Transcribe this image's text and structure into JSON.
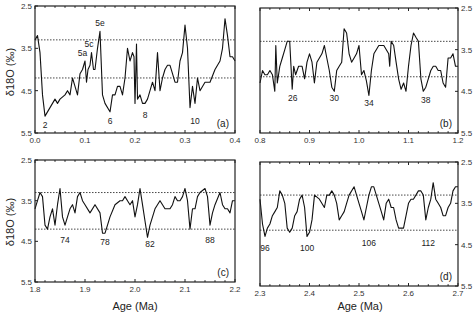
{
  "chart_data": [
    {
      "type": "line",
      "panel": "(a)",
      "xlabel": "",
      "ylabel": "δ18O (‰)",
      "xlim": [
        0.0,
        0.4
      ],
      "ylim": [
        5.5,
        2.5
      ],
      "y_inverted": true,
      "xticks": [
        "0.0",
        "0.1",
        "0.2",
        "0.3",
        "0.4"
      ],
      "yticks": [
        "2.5",
        "3.5",
        "4.5",
        "5.5"
      ],
      "reference_lines": [
        3.3,
        4.2
      ],
      "annotations": [
        {
          "text": "2",
          "x": 0.02,
          "y": 5.15
        },
        {
          "text": "5a",
          "x": 0.095,
          "y": 3.75
        },
        {
          "text": "5c",
          "x": 0.108,
          "y": 3.55
        },
        {
          "text": "5e",
          "x": 0.13,
          "y": 3.05
        },
        {
          "text": "6",
          "x": 0.15,
          "y": 5.05
        },
        {
          "text": "8",
          "x": 0.22,
          "y": 4.9
        },
        {
          "text": "10",
          "x": 0.32,
          "y": 5.05
        }
      ],
      "x": [
        0.0,
        0.005,
        0.01,
        0.015,
        0.02,
        0.03,
        0.04,
        0.045,
        0.05,
        0.06,
        0.065,
        0.07,
        0.075,
        0.08,
        0.085,
        0.09,
        0.095,
        0.1,
        0.103,
        0.106,
        0.11,
        0.113,
        0.117,
        0.12,
        0.125,
        0.13,
        0.135,
        0.14,
        0.15,
        0.155,
        0.16,
        0.165,
        0.17,
        0.175,
        0.18,
        0.185,
        0.19,
        0.195,
        0.198,
        0.2,
        0.203,
        0.205,
        0.21,
        0.215,
        0.22,
        0.225,
        0.23,
        0.235,
        0.24,
        0.245,
        0.25,
        0.255,
        0.26,
        0.265,
        0.27,
        0.275,
        0.28,
        0.285,
        0.29,
        0.295,
        0.3,
        0.305,
        0.31,
        0.315,
        0.32,
        0.325,
        0.33,
        0.34,
        0.35,
        0.36,
        0.37,
        0.375,
        0.38,
        0.385,
        0.39,
        0.395,
        0.4
      ],
      "y": [
        3.3,
        3.2,
        3.6,
        4.6,
        5.1,
        4.9,
        4.7,
        4.8,
        4.7,
        4.6,
        4.5,
        4.6,
        4.2,
        4.4,
        4.6,
        4.1,
        4.0,
        3.8,
        4.3,
        4.0,
        3.9,
        3.6,
        4.0,
        4.0,
        3.5,
        3.1,
        4.6,
        4.8,
        5.0,
        4.6,
        4.6,
        4.4,
        4.4,
        4.6,
        4.2,
        3.5,
        3.8,
        3.6,
        3.7,
        4.8,
        3.4,
        4.7,
        4.6,
        4.8,
        4.8,
        4.7,
        4.5,
        4.3,
        4.5,
        3.6,
        4.5,
        4.2,
        4.0,
        3.9,
        3.9,
        4.1,
        4.3,
        4.3,
        3.8,
        3.6,
        2.95,
        3.5,
        4.9,
        4.4,
        4.8,
        4.2,
        4.5,
        4.3,
        4.3,
        4.0,
        3.8,
        3.5,
        2.8,
        3.2,
        3.7,
        3.7,
        3.8
      ]
    },
    {
      "type": "line",
      "panel": "(b)",
      "xlabel": "",
      "ylabel": "",
      "xlim": [
        0.8,
        1.2
      ],
      "ylim": [
        5.5,
        2.5
      ],
      "y_inverted": true,
      "y_axis_side": "right",
      "xticks": [
        "0.8",
        "0.9",
        "1.0",
        "1.1",
        "1.2"
      ],
      "yticks": [
        "2.5",
        "3.5",
        "4.5",
        "5.5"
      ],
      "reference_lines": [
        3.3,
        4.15
      ],
      "annotations": [
        {
          "text": "26",
          "x": 0.866,
          "y": 4.5
        },
        {
          "text": "30",
          "x": 0.95,
          "y": 4.5
        },
        {
          "text": "34",
          "x": 1.02,
          "y": 4.6
        },
        {
          "text": "38",
          "x": 1.135,
          "y": 4.55
        }
      ],
      "x": [
        0.8,
        0.805,
        0.81,
        0.815,
        0.82,
        0.825,
        0.83,
        0.832,
        0.835,
        0.84,
        0.845,
        0.85,
        0.855,
        0.86,
        0.865,
        0.868,
        0.872,
        0.878,
        0.885,
        0.89,
        0.895,
        0.9,
        0.905,
        0.91,
        0.915,
        0.92,
        0.925,
        0.93,
        0.935,
        0.94,
        0.945,
        0.95,
        0.955,
        0.96,
        0.965,
        0.97,
        0.975,
        0.98,
        0.985,
        0.99,
        0.995,
        1.0,
        1.005,
        1.01,
        1.015,
        1.02,
        1.025,
        1.03,
        1.04,
        1.05,
        1.06,
        1.062,
        1.065,
        1.07,
        1.075,
        1.08,
        1.085,
        1.09,
        1.095,
        1.1,
        1.105,
        1.11,
        1.115,
        1.12,
        1.125,
        1.13,
        1.135,
        1.14,
        1.145,
        1.15,
        1.155,
        1.16,
        1.165,
        1.17,
        1.175,
        1.18,
        1.185,
        1.19,
        1.195,
        1.2
      ],
      "y": [
        4.3,
        4.0,
        4.1,
        4.1,
        4.0,
        4.1,
        4.5,
        3.4,
        4.3,
        3.9,
        3.7,
        3.5,
        3.3,
        3.3,
        4.45,
        3.9,
        4.1,
        3.9,
        3.9,
        4.2,
        3.8,
        3.6,
        3.8,
        4.3,
        3.8,
        3.7,
        3.6,
        3.4,
        3.7,
        4.0,
        4.4,
        4.5,
        4.0,
        3.9,
        3.8,
        3.0,
        3.1,
        3.6,
        3.8,
        3.7,
        3.6,
        3.4,
        4.1,
        4.0,
        4.25,
        4.6,
        4.0,
        3.6,
        3.4,
        3.4,
        3.6,
        3.9,
        3.3,
        3.4,
        3.8,
        4.2,
        4.45,
        4.3,
        4.5,
        3.9,
        3.4,
        3.1,
        3.2,
        3.3,
        4.2,
        4.5,
        4.4,
        4.2,
        4.0,
        3.9,
        3.9,
        4.0,
        4.0,
        4.3,
        4.4,
        3.7,
        3.7,
        3.6,
        3.9,
        3.9
      ]
    },
    {
      "type": "line",
      "panel": "(c)",
      "xlabel": "Age (Ma)",
      "ylabel": "δ18O (‰)",
      "xlim": [
        1.8,
        2.2
      ],
      "ylim": [
        5.5,
        2.5
      ],
      "y_inverted": true,
      "xticks": [
        "1.8",
        "1.9",
        "2.0",
        "2.1",
        "2.2"
      ],
      "yticks": [
        "2.5",
        "3.5",
        "4.5",
        "5.5"
      ],
      "reference_lines": [
        3.3,
        4.2
      ],
      "annotations": [
        {
          "text": "74",
          "x": 1.86,
          "y": 4.3
        },
        {
          "text": "78",
          "x": 1.94,
          "y": 4.35
        },
        {
          "text": "82",
          "x": 2.03,
          "y": 4.4
        },
        {
          "text": "88",
          "x": 2.15,
          "y": 4.3
        }
      ],
      "x": [
        1.8,
        1.805,
        1.81,
        1.815,
        1.82,
        1.825,
        1.83,
        1.835,
        1.84,
        1.845,
        1.85,
        1.855,
        1.86,
        1.865,
        1.87,
        1.875,
        1.88,
        1.885,
        1.89,
        1.895,
        1.9,
        1.91,
        1.92,
        1.93,
        1.935,
        1.94,
        1.945,
        1.95,
        1.96,
        1.97,
        1.975,
        1.98,
        1.985,
        1.99,
        1.995,
        2.0,
        2.005,
        2.01,
        2.015,
        2.02,
        2.025,
        2.03,
        2.04,
        2.045,
        2.05,
        2.055,
        2.06,
        2.07,
        2.075,
        2.08,
        2.085,
        2.09,
        2.095,
        2.1,
        2.105,
        2.11,
        2.115,
        2.12,
        2.125,
        2.13,
        2.14,
        2.145,
        2.15,
        2.155,
        2.16,
        2.17,
        2.175,
        2.18,
        2.185,
        2.19,
        2.195,
        2.2
      ],
      "y": [
        3.7,
        3.5,
        3.3,
        3.4,
        4.1,
        4.2,
        3.9,
        3.7,
        4.1,
        3.6,
        3.2,
        3.9,
        4.1,
        3.9,
        3.7,
        3.6,
        3.8,
        3.4,
        3.3,
        3.5,
        3.6,
        3.8,
        3.6,
        3.8,
        4.3,
        4.3,
        4.1,
        3.9,
        3.6,
        3.5,
        3.5,
        3.4,
        3.5,
        3.6,
        3.5,
        3.9,
        3.6,
        3.2,
        3.6,
        4.0,
        4.4,
        4.1,
        3.7,
        3.6,
        3.5,
        3.6,
        3.7,
        3.7,
        3.6,
        3.4,
        3.5,
        3.5,
        3.4,
        3.2,
        3.5,
        4.2,
        3.7,
        3.7,
        3.4,
        3.3,
        3.2,
        3.4,
        4.1,
        3.8,
        3.6,
        3.3,
        3.6,
        3.7,
        3.7,
        3.8,
        3.5,
        3.5
      ]
    },
    {
      "type": "line",
      "panel": "(d)",
      "xlabel": "Age (Ma)",
      "ylabel": "",
      "xlim": [
        2.3,
        2.7
      ],
      "ylim": [
        5.5,
        2.5
      ],
      "y_inverted": true,
      "y_axis_side": "right",
      "xticks": [
        "2.3",
        "2.4",
        "2.5",
        "2.6",
        "2.7"
      ],
      "yticks": [
        "2.5",
        "3.5",
        "4.5",
        "5.5"
      ],
      "reference_lines": [
        3.3,
        4.15
      ],
      "annotations": [
        {
          "text": "96",
          "x": 2.31,
          "y": 4.4
        },
        {
          "text": "100",
          "x": 2.395,
          "y": 4.4
        },
        {
          "text": "106",
          "x": 2.52,
          "y": 4.3
        },
        {
          "text": "112",
          "x": 2.64,
          "y": 4.3
        }
      ],
      "x": [
        2.3,
        2.305,
        2.31,
        2.315,
        2.32,
        2.325,
        2.33,
        2.335,
        2.34,
        2.345,
        2.35,
        2.355,
        2.36,
        2.365,
        2.37,
        2.375,
        2.38,
        2.385,
        2.39,
        2.395,
        2.4,
        2.405,
        2.41,
        2.42,
        2.43,
        2.435,
        2.44,
        2.445,
        2.45,
        2.455,
        2.46,
        2.465,
        2.47,
        2.475,
        2.48,
        2.49,
        2.5,
        2.505,
        2.51,
        2.515,
        2.52,
        2.525,
        2.53,
        2.54,
        2.545,
        2.55,
        2.555,
        2.56,
        2.565,
        2.57,
        2.575,
        2.58,
        2.59,
        2.6,
        2.605,
        2.61,
        2.615,
        2.62,
        2.625,
        2.63,
        2.635,
        2.64,
        2.645,
        2.65,
        2.655,
        2.66,
        2.665,
        2.67,
        2.675,
        2.68,
        2.685,
        2.69,
        2.695,
        2.7
      ],
      "y": [
        3.4,
        4.0,
        4.3,
        4.1,
        4.0,
        3.8,
        3.7,
        3.6,
        3.2,
        3.3,
        3.5,
        4.1,
        4.2,
        4.1,
        3.8,
        3.7,
        3.4,
        3.3,
        3.6,
        4.3,
        4.2,
        3.9,
        3.3,
        3.4,
        3.6,
        3.3,
        3.3,
        3.2,
        3.3,
        3.5,
        3.9,
        3.8,
        3.7,
        3.5,
        3.3,
        3.1,
        3.5,
        3.7,
        3.9,
        3.6,
        3.3,
        3.1,
        3.1,
        3.5,
        3.7,
        3.9,
        3.5,
        3.4,
        3.6,
        3.6,
        3.9,
        4.1,
        4.1,
        3.5,
        3.4,
        3.4,
        3.3,
        3.2,
        3.2,
        3.3,
        3.9,
        3.6,
        3.4,
        3.0,
        3.4,
        3.5,
        3.6,
        3.8,
        3.8,
        3.6,
        3.5,
        3.2,
        3.1,
        3.1
      ]
    }
  ],
  "labels": {
    "ylabel": "δ18O (‰)",
    "xlabel": "Age (Ma)",
    "panel_a": "(a)",
    "panel_b": "(b)",
    "panel_c": "(c)",
    "panel_d": "(d)"
  }
}
